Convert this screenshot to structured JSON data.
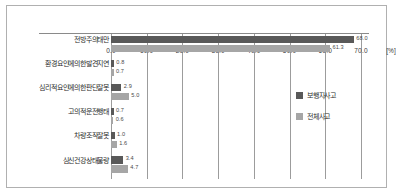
{
  "chart_data": {
    "type": "bar",
    "orientation": "horizontal",
    "title": "",
    "xlabel": "[%]",
    "ylabel": "",
    "xlim": [
      0,
      70
    ],
    "xticks": [
      "0.0",
      "10.0",
      "20.0",
      "30.0",
      "40.0",
      "50.0",
      "60.0",
      "70.0"
    ],
    "unit": "[%]",
    "grid": true,
    "legend_position": "right",
    "categories": [
      "전방주의태만",
      "환경요인에의한발견지연",
      "심리적요인에의한판단잘못",
      "고의적운전행태",
      "차량조작잘못",
      "심신건강상태불량"
    ],
    "series": [
      {
        "name": "보행자사고",
        "color": "#595959",
        "values": [
          68.0,
          0.8,
          2.9,
          0.7,
          1.0,
          3.4
        ],
        "labels": [
          "68.0",
          "0.8",
          "2.9",
          "0.7",
          "1.0",
          "3.4"
        ]
      },
      {
        "name": "전체사고",
        "color": "#a6a6a6",
        "values": [
          61.3,
          0.7,
          5.0,
          0.6,
          1.6,
          4.7
        ],
        "labels": [
          "61.3",
          "0.7",
          "5.0",
          "0.6",
          "1.6",
          "4.7"
        ]
      }
    ]
  }
}
